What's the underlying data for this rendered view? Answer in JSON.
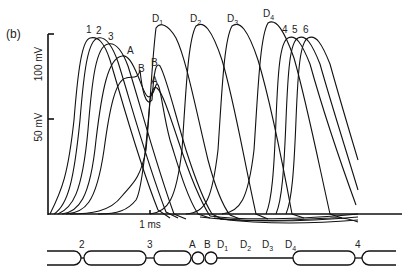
{
  "figure": {
    "panel_label": "(b)",
    "y_axis": {
      "tick_100_label": "100 mV",
      "tick_50_label": "50 mV"
    },
    "x_axis": {
      "tick_label": "1 ms"
    },
    "trace_labels": {
      "t1": "1",
      "t2": "2",
      "t3": "3",
      "tA": "A",
      "tB": "B",
      "tD1_main": "D",
      "tD1_sub": "1",
      "tB2": "B",
      "tA2": "A",
      "tD2_main": "D",
      "tD2_sub": "2",
      "tD3_main": "D",
      "tD3_sub": "3",
      "tD4_main": "D",
      "tD4_sub": "4",
      "t4": "4",
      "t5": "5",
      "t6": "6"
    },
    "axon_labels": {
      "n2": "2",
      "n3": "3",
      "nA": "A",
      "nB": "B",
      "nD1_main": "D",
      "nD1_sub": "1",
      "nD2_main": "D",
      "nD2_sub": "2",
      "nD3_main": "D",
      "nD3_sub": "3",
      "nD4_main": "D",
      "nD4_sub": "4",
      "n4": "4"
    }
  }
}
